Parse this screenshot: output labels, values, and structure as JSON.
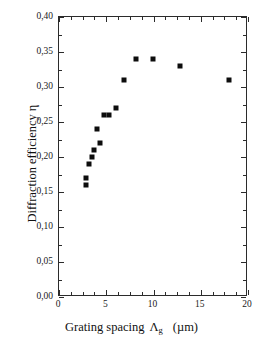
{
  "chart_data": {
    "type": "scatter",
    "title": "",
    "xlabel": "Grating spacing Λg (µm)",
    "ylabel": "Diffraction efficiency η",
    "xlim": [
      0,
      20
    ],
    "ylim": [
      0.0,
      0.4
    ],
    "grid": false,
    "legend": null,
    "marker": "filled-square",
    "marker_color": "#0d0d0d",
    "x": [
      2.9,
      2.9,
      3.2,
      3.5,
      3.7,
      4.0,
      4.3,
      4.8,
      5.3,
      6.0,
      6.9,
      8.2,
      9.9,
      12.8,
      18.0
    ],
    "y": [
      0.17,
      0.16,
      0.19,
      0.2,
      0.21,
      0.24,
      0.22,
      0.26,
      0.26,
      0.27,
      0.31,
      0.34,
      0.34,
      0.33,
      0.31
    ],
    "points": [
      {
        "x": 2.9,
        "y": 0.17
      },
      {
        "x": 2.9,
        "y": 0.16
      },
      {
        "x": 3.2,
        "y": 0.19
      },
      {
        "x": 3.5,
        "y": 0.2
      },
      {
        "x": 3.7,
        "y": 0.21
      },
      {
        "x": 4.0,
        "y": 0.24
      },
      {
        "x": 4.3,
        "y": 0.22
      },
      {
        "x": 4.8,
        "y": 0.26
      },
      {
        "x": 5.3,
        "y": 0.26
      },
      {
        "x": 6.0,
        "y": 0.27
      },
      {
        "x": 6.9,
        "y": 0.31
      },
      {
        "x": 8.2,
        "y": 0.34
      },
      {
        "x": 9.9,
        "y": 0.34
      },
      {
        "x": 12.8,
        "y": 0.33
      },
      {
        "x": 18.0,
        "y": 0.31
      }
    ],
    "xticks": [
      0,
      5,
      10,
      15,
      20
    ],
    "xtick_labels": [
      "0",
      "5",
      "10",
      "15",
      "20"
    ],
    "xminor_step": 1.25,
    "yticks": [
      0.0,
      0.05,
      0.1,
      0.15,
      0.2,
      0.25,
      0.3,
      0.35,
      0.4
    ],
    "ytick_labels": [
      "0,00",
      "0,05",
      "0,10",
      "0,15",
      "0,20",
      "0,25",
      "0,30",
      "0,35",
      "0,40"
    ],
    "yminor_step": 0.025
  },
  "axes": {
    "x_title_main": "Grating spacing",
    "x_title_symbol": "Λ",
    "x_title_subscript": "g",
    "x_title_units": "(µm)",
    "y_title": "Diffraction efficiency η"
  },
  "colors": {
    "marker": "#0d0d0d",
    "frame": "#2b2b2b",
    "background": "#ffffff",
    "text": "#1a1a1a"
  }
}
